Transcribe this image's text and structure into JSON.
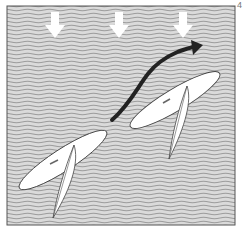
{
  "figure": {
    "number_label": "4",
    "elements": {
      "wind_arrows": {
        "count": 3,
        "direction": "down",
        "meaning": "wind direction"
      },
      "course_arrow": {
        "direction": "up-right",
        "meaning": "path of board"
      },
      "boards": [
        {
          "name": "board-before",
          "heading": "up-right"
        },
        {
          "name": "board-after",
          "heading": "up-right"
        }
      ]
    },
    "colors": {
      "water_bg": "#d4d4d4",
      "wave_line": "#9a9a9a",
      "frame": "#555555",
      "board": "#ffffff",
      "outline": "#444444",
      "course_arrow": "#222222",
      "wind_arrow": "#ffffff"
    }
  }
}
